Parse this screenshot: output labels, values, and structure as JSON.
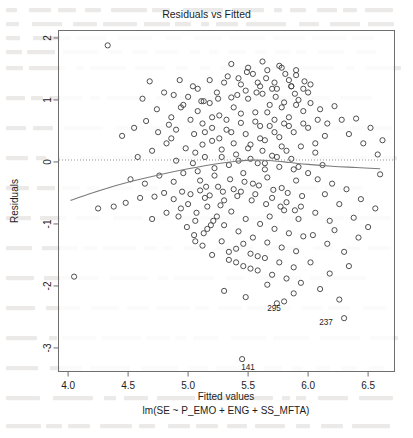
{
  "chart_data": {
    "type": "scatter",
    "title": "Residuals vs Fitted",
    "xlabel": "Fitted values",
    "sublabel": "lm(SE ~ P_EMO + ENG + SS_MFTA)",
    "ylabel": "Residuals",
    "xlim": [
      3.92,
      6.72
    ],
    "ylim": [
      -3.38,
      2.12
    ],
    "xticks": [
      4.0,
      4.5,
      5.0,
      5.5,
      6.0,
      6.5
    ],
    "xticklabels": [
      "4.0",
      "4.5",
      "5.0",
      "5.5",
      "6.0",
      "6.5"
    ],
    "yticks": [
      2,
      1,
      0,
      -1,
      -2,
      -3
    ],
    "yticklabels": [
      "2",
      "1",
      "0",
      "-1",
      "-2",
      "-3"
    ],
    "grid": false,
    "legend": null,
    "zero_reference_line": {
      "y": 0,
      "style": "dotted",
      "color": "#9a9a9a"
    },
    "smoother": {
      "name": "loess",
      "color": "#7b7b7b",
      "x": [
        4.02,
        4.2,
        4.4,
        4.6,
        4.8,
        5.0,
        5.2,
        5.4,
        5.55,
        5.7,
        5.85,
        6.0,
        6.2,
        6.4,
        6.6
      ],
      "y": [
        -0.62,
        -0.5,
        -0.38,
        -0.28,
        -0.19,
        -0.11,
        -0.04,
        0.01,
        0.03,
        0.02,
        -0.01,
        -0.04,
        -0.07,
        -0.09,
        -0.11
      ]
    },
    "marker": {
      "shape": "open-circle",
      "color": "#3c3c3c",
      "radius": 2.6
    },
    "labeled_points": [
      {
        "label": "295",
        "x": 5.8,
        "y": -2.25,
        "dx": -10,
        "dy": 10
      },
      {
        "label": "237",
        "x": 6.3,
        "y": -2.52,
        "dx": -18,
        "dy": 7
      },
      {
        "label": "141",
        "x": 5.45,
        "y": -3.18,
        "dx": 6,
        "dy": 11
      }
    ],
    "points": [
      [
        4.33,
        1.88
      ],
      [
        4.68,
        1.3
      ],
      [
        4.93,
        1.32
      ],
      [
        5.08,
        1.18
      ],
      [
        5.13,
        0.98
      ],
      [
        4.05,
        -1.85
      ],
      [
        4.25,
        -0.75
      ],
      [
        4.38,
        -0.72
      ],
      [
        4.48,
        -0.66
      ],
      [
        4.6,
        -0.58
      ],
      [
        4.72,
        -0.56
      ],
      [
        4.8,
        -0.5
      ],
      [
        4.88,
        -0.6
      ],
      [
        4.95,
        -0.48
      ],
      [
        5.02,
        -0.52
      ],
      [
        5.1,
        -0.46
      ],
      [
        5.18,
        -0.54
      ],
      [
        5.25,
        -0.4
      ],
      [
        5.3,
        -0.62
      ],
      [
        5.38,
        -0.44
      ],
      [
        4.58,
        0.08
      ],
      [
        4.7,
        0.18
      ],
      [
        4.82,
        0.3
      ],
      [
        4.9,
        0.02
      ],
      [
        4.98,
        0.22
      ],
      [
        5.05,
        0.45
      ],
      [
        5.12,
        0.62
      ],
      [
        5.2,
        0.34
      ],
      [
        5.26,
        0.75
      ],
      [
        5.32,
        0.52
      ],
      [
        5.38,
        0.88
      ],
      [
        5.44,
        0.63
      ],
      [
        5.5,
        1.02
      ],
      [
        5.56,
        0.8
      ],
      [
        5.62,
        1.1
      ],
      [
        5.68,
        0.92
      ],
      [
        5.74,
        1.18
      ],
      [
        5.8,
        0.96
      ],
      [
        5.86,
        1.22
      ],
      [
        5.92,
        1.0
      ],
      [
        4.86,
        0.72
      ],
      [
        4.94,
        0.88
      ],
      [
        5.0,
        1.05
      ],
      [
        5.06,
        0.15
      ],
      [
        5.14,
        0.08
      ],
      [
        5.22,
        -0.1
      ],
      [
        5.28,
        0.2
      ],
      [
        5.34,
        -0.05
      ],
      [
        5.4,
        0.12
      ],
      [
        5.46,
        -0.18
      ],
      [
        5.52,
        0.28
      ],
      [
        5.58,
        -0.02
      ],
      [
        5.64,
        0.35
      ],
      [
        5.7,
        0.1
      ],
      [
        5.76,
        0.4
      ],
      [
        5.82,
        0.18
      ],
      [
        5.88,
        0.48
      ],
      [
        5.94,
        0.25
      ],
      [
        6.0,
        0.55
      ],
      [
        6.06,
        0.3
      ],
      [
        5.1,
        -0.3
      ],
      [
        5.16,
        -0.72
      ],
      [
        5.24,
        -0.88
      ],
      [
        5.3,
        -1.02
      ],
      [
        5.36,
        -0.8
      ],
      [
        5.42,
        -1.12
      ],
      [
        5.48,
        -0.92
      ],
      [
        5.54,
        -1.22
      ],
      [
        5.6,
        -1.0
      ],
      [
        5.66,
        -1.3
      ],
      [
        5.72,
        -1.08
      ],
      [
        5.78,
        -1.38
      ],
      [
        5.84,
        -1.15
      ],
      [
        5.9,
        -1.44
      ],
      [
        5.96,
        -1.2
      ],
      [
        5.18,
        0.95
      ],
      [
        5.24,
        1.12
      ],
      [
        5.3,
        1.28
      ],
      [
        5.36,
        1.04
      ],
      [
        5.42,
        1.35
      ],
      [
        5.48,
        1.15
      ],
      [
        5.54,
        1.42
      ],
      [
        5.6,
        1.22
      ],
      [
        5.66,
        1.48
      ],
      [
        5.72,
        1.28
      ],
      [
        5.78,
        1.52
      ],
      [
        5.84,
        1.32
      ],
      [
        5.9,
        1.4
      ],
      [
        5.96,
        1.18
      ],
      [
        6.02,
        1.25
      ],
      [
        5.05,
        -1.18
      ],
      [
        5.12,
        -1.35
      ],
      [
        5.2,
        -1.5
      ],
      [
        5.28,
        -1.28
      ],
      [
        5.34,
        -1.58
      ],
      [
        5.4,
        -1.4
      ],
      [
        5.46,
        -1.68
      ],
      [
        5.52,
        -1.48
      ],
      [
        5.58,
        -1.75
      ],
      [
        5.64,
        -1.55
      ],
      [
        5.7,
        -1.82
      ],
      [
        5.76,
        -1.62
      ],
      [
        5.82,
        -1.88
      ],
      [
        5.88,
        -1.7
      ],
      [
        5.94,
        -1.95
      ],
      [
        4.45,
        0.42
      ],
      [
        4.55,
        0.55
      ],
      [
        4.65,
        0.66
      ],
      [
        4.75,
        0.48
      ],
      [
        4.84,
        0.6
      ],
      [
        6.1,
        0.85
      ],
      [
        6.16,
        0.62
      ],
      [
        6.22,
        0.9
      ],
      [
        6.28,
        0.68
      ],
      [
        6.34,
        0.45
      ],
      [
        6.4,
        0.7
      ],
      [
        6.46,
        0.3
      ],
      [
        6.52,
        0.55
      ],
      [
        6.58,
        0.12
      ],
      [
        6.62,
        0.35
      ],
      [
        6.08,
        -0.28
      ],
      [
        6.14,
        -0.52
      ],
      [
        6.2,
        -0.35
      ],
      [
        6.26,
        -0.68
      ],
      [
        6.32,
        -0.44
      ],
      [
        6.38,
        -0.9
      ],
      [
        6.44,
        -0.6
      ],
      [
        6.5,
        -1.05
      ],
      [
        6.56,
        -0.75
      ],
      [
        6.6,
        -0.2
      ],
      [
        5.42,
        0.02
      ],
      [
        5.48,
        0.45
      ],
      [
        5.54,
        -0.35
      ],
      [
        5.6,
        0.58
      ],
      [
        5.66,
        -0.25
      ],
      [
        5.72,
        0.68
      ],
      [
        5.78,
        -0.42
      ],
      [
        5.84,
        0.72
      ],
      [
        5.9,
        -0.3
      ],
      [
        5.96,
        0.82
      ],
      [
        5.02,
        0.68
      ],
      [
        5.08,
        0.82
      ],
      [
        5.14,
        0.48
      ],
      [
        5.2,
        0.72
      ],
      [
        5.26,
        0.38
      ],
      [
        5.32,
        0.68
      ],
      [
        5.38,
        0.3
      ],
      [
        5.44,
        0.78
      ],
      [
        5.5,
        0.22
      ],
      [
        5.56,
        0.65
      ],
      [
        5.62,
        0.18
      ],
      [
        5.68,
        0.58
      ],
      [
        5.74,
        0.08
      ],
      [
        5.8,
        0.62
      ],
      [
        5.86,
        0.05
      ],
      [
        5.08,
        -0.15
      ],
      [
        5.15,
        -0.4
      ],
      [
        5.22,
        -0.22
      ],
      [
        5.29,
        -0.48
      ],
      [
        5.35,
        -0.28
      ],
      [
        5.41,
        -0.55
      ],
      [
        5.47,
        -0.32
      ],
      [
        5.53,
        -0.62
      ],
      [
        5.59,
        -0.38
      ],
      [
        5.65,
        -0.68
      ],
      [
        5.71,
        -0.45
      ],
      [
        5.77,
        -0.72
      ],
      [
        5.83,
        -0.5
      ],
      [
        5.89,
        -0.78
      ],
      [
        5.95,
        -0.55
      ],
      [
        4.92,
        -0.88
      ],
      [
        4.99,
        -1.05
      ],
      [
        5.06,
        -0.95
      ],
      [
        5.13,
        -1.15
      ],
      [
        5.19,
        -1.02
      ],
      [
        5.6,
        0.38
      ],
      [
        5.66,
        0.8
      ],
      [
        5.72,
        0.48
      ],
      [
        5.78,
        0.88
      ],
      [
        5.84,
        0.58
      ],
      [
        5.9,
        0.92
      ],
      [
        5.96,
        0.62
      ],
      [
        6.02,
        0.95
      ],
      [
        6.08,
        0.68
      ],
      [
        6.14,
        0.42
      ],
      [
        4.88,
        1.08
      ],
      [
        4.96,
        0.92
      ],
      [
        5.04,
        1.22
      ],
      [
        5.11,
        0.98
      ],
      [
        5.18,
        1.32
      ],
      [
        5.25,
        1.02
      ],
      [
        5.33,
        1.38
      ],
      [
        5.41,
        1.08
      ],
      [
        5.49,
        1.45
      ],
      [
        5.57,
        1.12
      ],
      [
        5.65,
        1.35
      ],
      [
        5.73,
        1.05
      ],
      [
        5.81,
        1.42
      ],
      [
        5.89,
        1.1
      ],
      [
        5.97,
        1.3
      ],
      [
        5.3,
        -2.08
      ],
      [
        5.48,
        -2.18
      ],
      [
        5.66,
        -1.98
      ],
      [
        5.74,
        -2.28
      ],
      [
        5.88,
        -2.12
      ],
      [
        6.02,
        -1.62
      ],
      [
        6.1,
        -2.05
      ],
      [
        6.18,
        -1.8
      ],
      [
        6.26,
        -2.22
      ],
      [
        6.34,
        -1.68
      ],
      [
        4.62,
        1.02
      ],
      [
        4.74,
        0.85
      ],
      [
        4.8,
        1.12
      ],
      [
        4.86,
        0.38
      ],
      [
        4.9,
        0.52
      ],
      [
        5.0,
        -0.68
      ],
      [
        5.07,
        -0.82
      ],
      [
        5.14,
        -0.58
      ],
      [
        5.21,
        -0.95
      ],
      [
        5.27,
        -0.7
      ],
      [
        5.34,
        -1.45
      ],
      [
        5.4,
        -1.62
      ],
      [
        5.46,
        -1.32
      ],
      [
        5.52,
        -1.72
      ],
      [
        5.58,
        -1.52
      ],
      [
        5.64,
        -0.12
      ],
      [
        5.7,
        -0.58
      ],
      [
        5.76,
        -0.08
      ],
      [
        5.82,
        -0.65
      ],
      [
        5.88,
        -0.12
      ],
      [
        5.94,
        -0.72
      ],
      [
        6.0,
        -0.18
      ],
      [
        6.06,
        -0.82
      ],
      [
        6.12,
        -0.05
      ],
      [
        6.18,
        -0.95
      ],
      [
        5.36,
        1.58
      ],
      [
        5.5,
        1.52
      ],
      [
        5.62,
        1.62
      ],
      [
        5.76,
        1.55
      ],
      [
        5.9,
        1.48
      ],
      [
        5.44,
        1.25
      ],
      [
        5.58,
        1.28
      ],
      [
        5.7,
        1.18
      ],
      [
        5.86,
        1.22
      ],
      [
        6.0,
        1.12
      ],
      [
        4.52,
        -0.28
      ],
      [
        4.64,
        -0.35
      ],
      [
        4.76,
        -0.22
      ],
      [
        4.88,
        -0.32
      ],
      [
        4.96,
        -0.18
      ],
      [
        5.04,
        -0.02
      ],
      [
        5.12,
        0.28
      ],
      [
        5.2,
        0.55
      ],
      [
        5.28,
        0.08
      ],
      [
        5.36,
        0.48
      ],
      [
        5.44,
        -0.48
      ],
      [
        5.56,
        -0.52
      ],
      [
        5.68,
        -0.88
      ],
      [
        5.8,
        -0.78
      ],
      [
        5.92,
        -0.92
      ],
      [
        6.04,
        -1.18
      ],
      [
        6.16,
        -1.32
      ],
      [
        6.22,
        -1.1
      ],
      [
        6.3,
        -1.45
      ],
      [
        6.42,
        -1.22
      ],
      [
        5.52,
        0.05
      ],
      [
        5.64,
        -0.02
      ],
      [
        5.78,
        0.25
      ],
      [
        5.92,
        -0.08
      ],
      [
        6.06,
        0.15
      ],
      [
        4.7,
        -0.92
      ],
      [
        4.82,
        -0.82
      ],
      [
        4.94,
        -0.75
      ],
      [
        5.06,
        -1.28
      ],
      [
        5.16,
        -1.08
      ]
    ]
  }
}
